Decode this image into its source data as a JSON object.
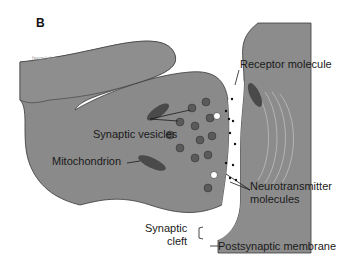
{
  "figure": {
    "panel_letter": "B"
  },
  "labels": {
    "receptor": "Receptor molecule",
    "vesicles": "Synaptic vesicles",
    "mitochondrion": "Mitochondrion",
    "neurotransmitter_line1": "Neurotransmitter",
    "neurotransmitter_line2": "molecules",
    "cleft_line1": "Synaptic",
    "cleft_line2": "cleft",
    "postsynaptic": "Postsynaptic membrane"
  },
  "colors": {
    "neuron_fill": "#8a8a8a",
    "neuron_dark": "#6e6e6e",
    "outline": "#3a3a3a",
    "cleft": "#ffffff",
    "vesicle": "#5a5a5a",
    "mitochondrion": "#4a4a4a"
  }
}
